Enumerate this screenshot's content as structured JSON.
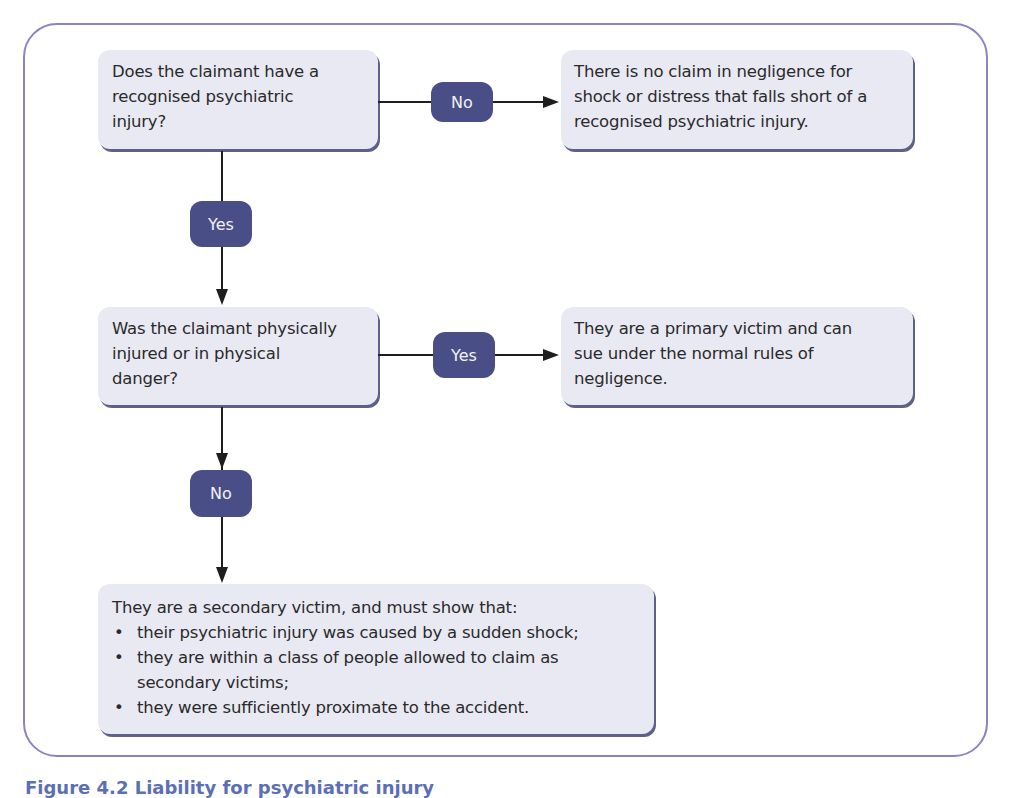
{
  "colors": {
    "frame_border": "#8b83c4",
    "box_fill": "#e9e9f3",
    "box_shadow": "#5e6088",
    "pill_fill": "#4a4e86",
    "pill_text": "#f2f2f8",
    "connector": "#1e1e1e",
    "caption": "#5b6fb6"
  },
  "nodes": {
    "q1": {
      "text": "Does the claimant have a recognised psychiatric injury?"
    },
    "r1": {
      "text": "There is no claim in negligence for shock or distress that falls short of a recognised psychiatric injury."
    },
    "q2": {
      "text": "Was the claimant physically injured or in physical danger?"
    },
    "r2": {
      "text": "They are a primary victim and can sue under the normal rules of negligence."
    },
    "r3": {
      "intro": "They are a secondary victim, and must show that:",
      "bullets": [
        "their psychiatric injury was caused by a sudden shock;",
        "they are within a class of people allowed to claim as secondary victims;",
        "they were sufficiently proximate to the accident."
      ]
    }
  },
  "edges": {
    "q1_to_r1": "No",
    "q1_to_q2": "Yes",
    "q2_to_r2": "Yes",
    "q2_to_r3": "No"
  },
  "caption": "Figure 4.2 Liability for psychiatric injury"
}
